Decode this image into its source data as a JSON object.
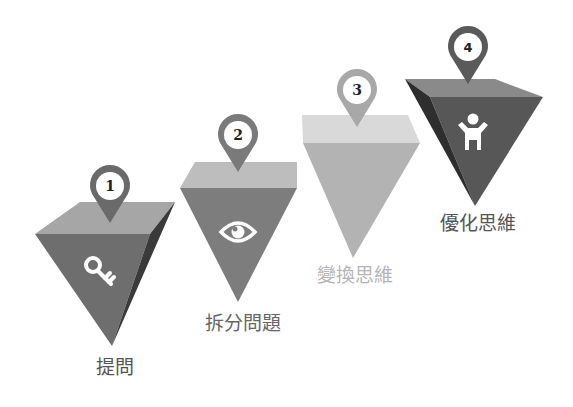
{
  "diagram": {
    "type": "stepped-pyramid-process",
    "steps": [
      {
        "number": "1",
        "label": "提問",
        "icon": "key-icon",
        "colors": {
          "top": "#a6a6a6",
          "front": "#6e6e6e",
          "side": "#3a3a3a",
          "pin": "#6a6a6a",
          "label": "#555555"
        }
      },
      {
        "number": "2",
        "label": "拆分問題",
        "icon": "eye-icon",
        "colors": {
          "top": "#bdbdbd",
          "front": "#7d7d7d",
          "side": "#7d7d7d",
          "pin": "#7a7a7a",
          "label": "#666666"
        }
      },
      {
        "number": "3",
        "label": "變換思維",
        "icon": "",
        "colors": {
          "top": "#d9d9d9",
          "front": "#b3b3b3",
          "side": "#b3b3b3",
          "pin": "#a8a8a8",
          "label": "#b5b5b5"
        }
      },
      {
        "number": "4",
        "label": "優化思維",
        "icon": "child-icon",
        "colors": {
          "top": "#8a8a8a",
          "front": "#575757",
          "side": "#2e2e2e",
          "pin": "#5a5a5a",
          "label": "#555555"
        }
      }
    ]
  }
}
